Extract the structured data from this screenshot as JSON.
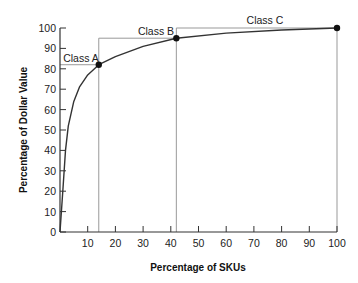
{
  "chart_data": {
    "type": "line",
    "title": "",
    "xlabel": "Percentage of SKUs",
    "ylabel": "Percentage of Dollar Value",
    "xlim": [
      0,
      100
    ],
    "ylim": [
      0,
      100
    ],
    "x_ticks": [
      10,
      20,
      30,
      40,
      50,
      60,
      70,
      80,
      90,
      100
    ],
    "y_ticks": [
      0,
      10,
      20,
      30,
      40,
      50,
      60,
      70,
      80,
      90,
      100
    ],
    "grid": false,
    "legend": "none",
    "series": [
      {
        "name": "Cumulative dollar value",
        "x": [
          0,
          1,
          2,
          3,
          5,
          7,
          10,
          14,
          20,
          30,
          42,
          60,
          80,
          100
        ],
        "values": [
          0,
          20,
          40,
          52,
          64,
          71,
          77,
          82,
          86,
          91,
          95,
          97.5,
          99,
          100
        ]
      }
    ],
    "class_points": [
      {
        "label": "Class A",
        "x": 14,
        "y": 82
      },
      {
        "label": "Class B",
        "x": 42,
        "y": 95
      },
      {
        "label": "Class C",
        "x": 100,
        "y": 100
      }
    ],
    "annotations": [
      "Class A",
      "Class B",
      "Class C"
    ]
  },
  "labels": {
    "xlabel": "Percentage of SKUs",
    "ylabel": "Percentage of Dollar Value",
    "class_a": "Class A",
    "class_b": "Class B",
    "class_c": "Class C"
  }
}
